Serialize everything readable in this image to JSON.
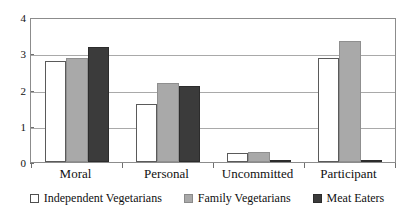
{
  "chart_data": {
    "type": "bar",
    "title": "",
    "subtitle": "",
    "xlabel": "",
    "ylabel": "",
    "categories": [
      "Moral",
      "Personal",
      "Uncommitted",
      "Participant"
    ],
    "series": [
      {
        "name": "Independent Vegetarians",
        "color": "#ffffff",
        "values": [
          2.8,
          1.6,
          0.25,
          2.9
        ]
      },
      {
        "name": "Family Vegetarians",
        "color": "#a9a9a9",
        "values": [
          2.9,
          2.2,
          0.27,
          3.35
        ]
      },
      {
        "name": "Meat Eaters",
        "color": "#3b3b3b",
        "values": [
          3.2,
          2.1,
          0.03,
          0.02
        ]
      }
    ],
    "ylim": [
      0,
      4
    ],
    "y_ticks": [
      0,
      1,
      2,
      3,
      4
    ],
    "y_tick_labels": [
      "0",
      "1",
      "2",
      "3",
      "4"
    ],
    "grid": true,
    "grid_axis": "y",
    "legend_position": "bottom"
  },
  "legend": {
    "items": [
      {
        "label": "Independent Vegetarians",
        "swatch": "independent"
      },
      {
        "label": "Family Vegetarians",
        "swatch": "family"
      },
      {
        "label": "Meat Eaters",
        "swatch": "meat"
      }
    ]
  }
}
